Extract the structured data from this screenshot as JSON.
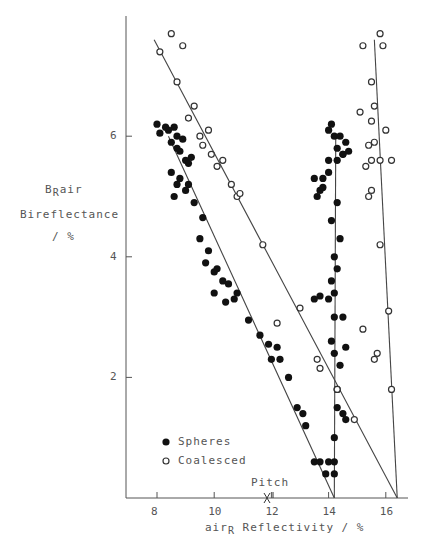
{
  "chart_data": {
    "type": "scatter",
    "title": "",
    "xlabel": "airR Reflectivity / %",
    "xlabel_parts": {
      "pre": "air",
      "sub": "R",
      "post": " Reflectivity / %"
    },
    "ylabel_lines": [
      "BRair",
      "Bireflectance",
      "/ %"
    ],
    "ylabel_parts": {
      "pre": "B",
      "sub": "R",
      "post": "air"
    },
    "ylabel_line2": "Bireflectance",
    "ylabel_line3": "/ %",
    "xlim": [
      7,
      17
    ],
    "ylim": [
      0,
      7.9
    ],
    "x_ticks": [
      8,
      10,
      12,
      14,
      16
    ],
    "y_ticks": [
      2,
      4,
      6
    ],
    "grid": false,
    "legend_position": "lower-left inside",
    "legend": [
      {
        "name": "Spheres",
        "marker": "filled-circle"
      },
      {
        "name": "Coalesced",
        "marker": "open-circle"
      }
    ],
    "annotations": [
      {
        "text": "Pitch",
        "x": 11.85,
        "y": 0,
        "marker": "X"
      }
    ],
    "fit_lines": [
      {
        "series": "Spheres",
        "from": [
          8.4,
          6.0
        ],
        "to": [
          14.2,
          0
        ]
      },
      {
        "series": "Spheres",
        "from": [
          14.25,
          6.0
        ],
        "to": [
          14.2,
          0
        ]
      },
      {
        "series": "Coalesced",
        "from": [
          7.9,
          7.6
        ],
        "to": [
          16.4,
          0
        ]
      },
      {
        "series": "Coalesced",
        "from": [
          15.6,
          7.6
        ],
        "to": [
          16.4,
          0
        ]
      }
    ],
    "series": [
      {
        "name": "Spheres",
        "marker": "filled",
        "points": [
          [
            8.0,
            6.2
          ],
          [
            8.3,
            6.15
          ],
          [
            8.6,
            6.15
          ],
          [
            8.1,
            6.05
          ],
          [
            8.4,
            6.1
          ],
          [
            8.7,
            6.0
          ],
          [
            8.5,
            5.9
          ],
          [
            8.9,
            5.95
          ],
          [
            8.7,
            5.8
          ],
          [
            8.8,
            5.75
          ],
          [
            9.0,
            5.6
          ],
          [
            9.1,
            5.55
          ],
          [
            9.2,
            5.65
          ],
          [
            8.5,
            5.4
          ],
          [
            8.7,
            5.2
          ],
          [
            8.8,
            5.3
          ],
          [
            9.0,
            5.1
          ],
          [
            9.1,
            5.2
          ],
          [
            8.6,
            5.0
          ],
          [
            9.3,
            4.9
          ],
          [
            9.6,
            4.65
          ],
          [
            9.5,
            4.3
          ],
          [
            9.8,
            4.1
          ],
          [
            10.0,
            3.75
          ],
          [
            10.1,
            3.8
          ],
          [
            9.7,
            3.9
          ],
          [
            10.3,
            3.6
          ],
          [
            10.5,
            3.55
          ],
          [
            10.0,
            3.4
          ],
          [
            10.4,
            3.25
          ],
          [
            10.7,
            3.3
          ],
          [
            10.8,
            3.4
          ],
          [
            11.2,
            2.95
          ],
          [
            11.6,
            2.7
          ],
          [
            11.9,
            2.55
          ],
          [
            12.0,
            2.3
          ],
          [
            12.2,
            2.5
          ],
          [
            12.3,
            2.3
          ],
          [
            12.6,
            2.0
          ],
          [
            12.9,
            1.5
          ],
          [
            13.1,
            1.4
          ],
          [
            13.2,
            1.2
          ],
          [
            13.5,
            0.6
          ],
          [
            13.7,
            0.6
          ],
          [
            13.9,
            0.4
          ],
          [
            14.0,
            0.6
          ],
          [
            14.2,
            0.6
          ],
          [
            14.2,
            0.4
          ],
          [
            14.2,
            1.0
          ],
          [
            14.3,
            1.5
          ],
          [
            14.5,
            1.4
          ],
          [
            14.6,
            1.3
          ],
          [
            14.3,
            1.8
          ],
          [
            14.4,
            2.2
          ],
          [
            14.2,
            2.4
          ],
          [
            14.6,
            2.5
          ],
          [
            14.1,
            2.6
          ],
          [
            14.2,
            3.0
          ],
          [
            14.2,
            3.4
          ],
          [
            14.5,
            3.0
          ],
          [
            14.0,
            3.3
          ],
          [
            13.7,
            3.35
          ],
          [
            13.5,
            3.3
          ],
          [
            14.1,
            3.6
          ],
          [
            14.3,
            3.8
          ],
          [
            14.2,
            4.0
          ],
          [
            14.4,
            4.3
          ],
          [
            14.1,
            4.6
          ],
          [
            14.3,
            4.9
          ],
          [
            13.6,
            5.0
          ],
          [
            13.7,
            5.1
          ],
          [
            13.8,
            5.15
          ],
          [
            13.5,
            5.3
          ],
          [
            13.8,
            5.3
          ],
          [
            14.0,
            5.4
          ],
          [
            14.0,
            5.6
          ],
          [
            14.3,
            5.6
          ],
          [
            14.5,
            5.7
          ],
          [
            14.3,
            5.8
          ],
          [
            14.6,
            5.9
          ],
          [
            14.2,
            6.0
          ],
          [
            14.4,
            6.0
          ],
          [
            14.0,
            6.1
          ],
          [
            14.1,
            6.2
          ],
          [
            14.5,
            5.7
          ],
          [
            14.7,
            5.75
          ]
        ]
      },
      {
        "name": "Coalesced",
        "marker": "open",
        "points": [
          [
            8.1,
            7.4
          ],
          [
            8.5,
            7.7
          ],
          [
            8.9,
            7.5
          ],
          [
            8.7,
            6.9
          ],
          [
            9.3,
            6.5
          ],
          [
            9.1,
            6.3
          ],
          [
            9.8,
            6.1
          ],
          [
            9.5,
            6.0
          ],
          [
            9.6,
            5.85
          ],
          [
            9.9,
            5.7
          ],
          [
            10.3,
            5.6
          ],
          [
            10.1,
            5.5
          ],
          [
            10.6,
            5.2
          ],
          [
            10.8,
            5.0
          ],
          [
            10.9,
            5.05
          ],
          [
            11.7,
            4.2
          ],
          [
            13.0,
            3.15
          ],
          [
            12.2,
            2.9
          ],
          [
            13.6,
            2.3
          ],
          [
            13.7,
            2.15
          ],
          [
            14.3,
            1.8
          ],
          [
            14.9,
            1.3
          ],
          [
            15.2,
            2.8
          ],
          [
            15.6,
            2.3
          ],
          [
            15.7,
            2.4
          ],
          [
            16.2,
            1.8
          ],
          [
            16.1,
            3.1
          ],
          [
            15.8,
            4.2
          ],
          [
            15.4,
            5.0
          ],
          [
            15.5,
            5.1
          ],
          [
            15.3,
            5.5
          ],
          [
            15.5,
            5.6
          ],
          [
            15.6,
            5.9
          ],
          [
            15.4,
            5.85
          ],
          [
            15.8,
            5.6
          ],
          [
            16.2,
            5.6
          ],
          [
            15.5,
            6.25
          ],
          [
            15.6,
            6.5
          ],
          [
            16.0,
            6.1
          ],
          [
            15.5,
            6.9
          ],
          [
            15.1,
            6.4
          ],
          [
            15.9,
            7.5
          ],
          [
            15.8,
            7.7
          ],
          [
            15.2,
            7.5
          ]
        ]
      }
    ]
  },
  "legend": {
    "spheres_label": "Spheres",
    "coalesced_label": "Coalesced"
  },
  "annotation": {
    "pitch_label": "Pitch"
  },
  "axes": {
    "x_tick_labels": [
      "8",
      "10",
      "12",
      "14",
      "16"
    ],
    "y_tick_labels": [
      "2",
      "4",
      "6"
    ],
    "x_label_pre": "air",
    "x_label_sub": "R",
    "x_label_post": " Reflectivity / %",
    "y_label_pre": "B",
    "y_label_sub": "R",
    "y_label_post": "air",
    "y_label_line2": "Bireflectance",
    "y_label_line3": "/ %"
  }
}
